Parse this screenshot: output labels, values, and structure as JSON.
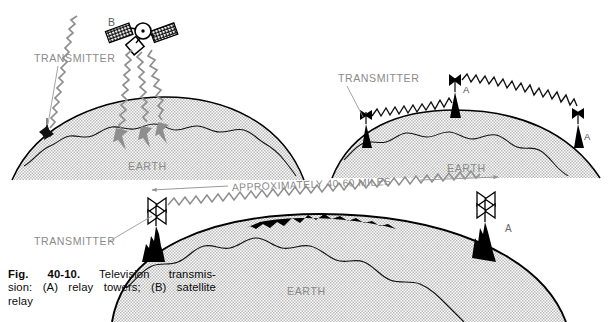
{
  "figure": {
    "number_label": "Fig. 40-10.",
    "caption_text": "Television transmission: (A) relay towers; (B) satellite relay",
    "caption_line1": "Television  transmis-",
    "caption_line2": "sion: (A) relay towers; (B) satellite",
    "caption_line3": "relay"
  },
  "colors": {
    "ink": "#000000",
    "gray_text": "#8a8a8a",
    "gray_wave": "#8e8e8e",
    "gray_leader": "#9a9a9a",
    "earth_fill": "#e2e2e2",
    "tower_black": "#000000",
    "page_bg": "#ffffff"
  },
  "panel_satellite": {
    "id": "B",
    "satellite_label": "B",
    "transmitter_label": "TRANSMITTER",
    "earth_label": "EARTH",
    "beam_count": 3,
    "uplink_count": 1
  },
  "panel_relay_top": {
    "id": "A",
    "transmitter_label": "TRANSMITTER",
    "earth_label": "EARTH",
    "tower_labels": [
      "A",
      "A"
    ],
    "hop_count": 2
  },
  "panel_relay_bottom": {
    "id": "A",
    "transmitter_label": "TRANSMITTER",
    "earth_label": "EARTH",
    "tower_label": "A",
    "distance_label": "APPROXIMATELY 40-60 MILES",
    "hop_count": 1
  }
}
